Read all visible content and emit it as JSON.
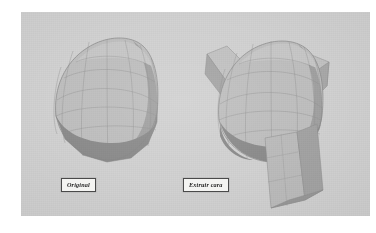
{
  "figure": {
    "background_color": "#ffffff",
    "panel_color": "#d2d2d2"
  },
  "captions": [
    {
      "id": "original",
      "label": "Original",
      "box_color": "#f4f4f2",
      "border_color": "#4a4a4a",
      "text_color": "#1d1d1d"
    },
    {
      "id": "extrude-face",
      "label": "Extruir cara",
      "box_color": "#f4f4f2",
      "border_color": "#4a4a4a",
      "text_color": "#1d1d1d"
    }
  ],
  "models": [
    {
      "id": "sphere-original",
      "name": "Faceted sphere - original",
      "description": "Low-poly latitude/longitude sphere shown unmodified",
      "shading": {
        "top_light": "#c6c6c6",
        "upper_mid": "#bdbdbd",
        "mid": "#b3b3b3",
        "right_shadow": "#9e9e9e",
        "bottom_shadow": "#8a8a8a",
        "wire_color": "#8e8e8e"
      }
    },
    {
      "id": "sphere-extruded",
      "name": "Faceted sphere - extruded faces",
      "description": "Same sphere with three faces extruded outward: upper-left, upper-right, and a long lower extrusion",
      "extrusions": [
        {
          "id": "extrusion-upper-left",
          "position": "upper-left"
        },
        {
          "id": "extrusion-upper-right",
          "position": "upper-right"
        },
        {
          "id": "extrusion-bottom",
          "position": "bottom-long"
        }
      ],
      "shading": {
        "top_light": "#c6c6c6",
        "upper_mid": "#bdbdbd",
        "mid": "#b3b3b3",
        "right_shadow": "#9e9e9e",
        "bottom_shadow": "#8a8a8a",
        "extrusion_face": "#bcbcbc",
        "extrusion_side": "#a4a4a4",
        "wire_color": "#8e8e8e"
      }
    }
  ]
}
